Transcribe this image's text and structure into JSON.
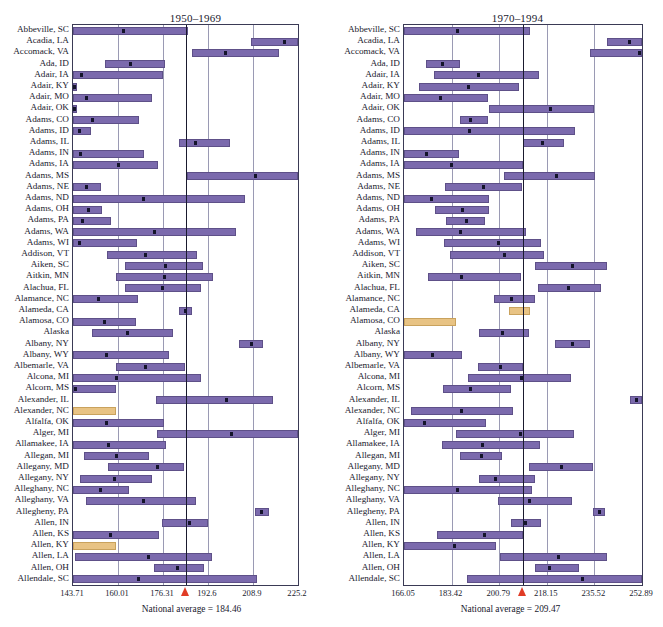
{
  "figure": {
    "width": 663,
    "height": 627,
    "bar_color": "#7b6aad",
    "highlight_color": "#e8c384",
    "marker_color": "#14142b",
    "avg_line_color": "#1a1a2e",
    "arrow_color": "#e03c26",
    "grid_color": "#9a9ab4"
  },
  "chart_data": [
    {
      "type": "bar",
      "panel": "left",
      "title": "1950–1969",
      "xlabel": "",
      "ylabel": "",
      "grid": true,
      "orientation": "horizontal",
      "xlim": [
        143.71,
        225.2
      ],
      "xticks": [
        143.71,
        160.01,
        176.31,
        192.6,
        208.9,
        225.2
      ],
      "xticklabels": [
        "143.71",
        "160.01",
        "176.31",
        "192.6",
        "208.9",
        "225.2"
      ],
      "annotation": "National average = 184.46",
      "national_average": 184.46,
      "categories": [
        "Abbeville, SC",
        "Acadia, LA",
        "Accomack, VA",
        "Ada, ID",
        "Adair, IA",
        "Adair, KY",
        "Adair, MO",
        "Adair, OK",
        "Adams, CO",
        "Adams, ID",
        "Adams, IL",
        "Adams, IN",
        "Adams, IA",
        "Adams, MS",
        "Adams, NE",
        "Adams, ND",
        "Adams, OH",
        "Adams, PA",
        "Adams, WA",
        "Adams, WI",
        "Addison, VT",
        "Aiken, SC",
        "Aitkin, MN",
        "Alachua, FL",
        "Alamance, NC",
        "Alameda, CA",
        "Alamosa, CO",
        "Alaska",
        "Albany, NY",
        "Albany, WY",
        "Albemarle, VA",
        "Alcona, MI",
        "Alcorn, MS",
        "Alexander, IL",
        "Alexander, NC",
        "Alfalfa, OK",
        "Alger, MI",
        "Allamakee, IA",
        "Allegan, MI",
        "Allegany, MD",
        "Allegany, NY",
        "Alleghany, NC",
        "Alleghany, VA",
        "Allegheny, PA",
        "Allen, IN",
        "Allen, KS",
        "Allen, KY",
        "Allen, LA",
        "Allen, OH",
        "Allendale, SC"
      ],
      "ranges": [
        {
          "low": 143.71,
          "high": 185.2,
          "mean": 161.9,
          "highlight": false
        },
        {
          "low": 208.0,
          "high": 225.2,
          "mean": 220.3,
          "highlight": false
        },
        {
          "low": 186.9,
          "high": 218.2,
          "mean": 198.9,
          "highlight": false
        },
        {
          "low": 155.3,
          "high": 176.9,
          "mean": 164.6,
          "highlight": false
        },
        {
          "low": 143.71,
          "high": 176.3,
          "mean": 146.9,
          "highlight": false
        },
        {
          "low": 143.71,
          "high": 145.1,
          "mean": 144.2,
          "highlight": false
        },
        {
          "low": 143.71,
          "high": 172.2,
          "mean": 148.6,
          "highlight": false
        },
        {
          "low": 143.71,
          "high": 145.1,
          "mean": 144.2,
          "highlight": false
        },
        {
          "low": 143.71,
          "high": 167.5,
          "mean": 150.8,
          "highlight": false
        },
        {
          "low": 143.71,
          "high": 150.1,
          "mean": 146.2,
          "highlight": false
        },
        {
          "low": 182.0,
          "high": 200.5,
          "mean": 188.2,
          "highlight": false
        },
        {
          "low": 143.71,
          "high": 169.4,
          "mean": 146.4,
          "highlight": false
        },
        {
          "low": 143.71,
          "high": 174.4,
          "mean": 160.3,
          "highlight": false
        },
        {
          "low": 185.0,
          "high": 225.2,
          "mean": 209.9,
          "highlight": false
        },
        {
          "low": 143.71,
          "high": 153.9,
          "mean": 148.5,
          "highlight": false
        },
        {
          "low": 143.71,
          "high": 205.9,
          "mean": 169.2,
          "highlight": false
        },
        {
          "low": 143.71,
          "high": 154.2,
          "mean": 149.2,
          "highlight": false
        },
        {
          "low": 143.71,
          "high": 157.5,
          "mean": 147.0,
          "highlight": false
        },
        {
          "low": 143.71,
          "high": 202.6,
          "mean": 173.1,
          "highlight": false
        },
        {
          "low": 143.71,
          "high": 166.8,
          "mean": 145.9,
          "highlight": false
        },
        {
          "low": 156.0,
          "high": 188.8,
          "mean": 169.8,
          "highlight": false
        },
        {
          "low": 162.5,
          "high": 190.9,
          "mean": 177.1,
          "highlight": false
        },
        {
          "low": 159.4,
          "high": 194.4,
          "mean": 177.0,
          "highlight": false
        },
        {
          "low": 162.4,
          "high": 190.2,
          "mean": 176.2,
          "highlight": false
        },
        {
          "low": 143.71,
          "high": 167.1,
          "mean": 153.1,
          "highlight": false
        },
        {
          "low": 182.0,
          "high": 186.9,
          "mean": 184.4,
          "highlight": false
        },
        {
          "low": 143.71,
          "high": 166.4,
          "mean": 155.0,
          "highlight": false
        },
        {
          "low": 150.6,
          "high": 180.0,
          "mean": 163.6,
          "highlight": false
        },
        {
          "low": 204.0,
          "high": 212.5,
          "mean": 208.3,
          "highlight": false
        },
        {
          "low": 143.71,
          "high": 178.6,
          "mean": 156.0,
          "highlight": false
        },
        {
          "low": 159.3,
          "high": 184.2,
          "mean": 170.0,
          "highlight": false
        },
        {
          "low": 143.71,
          "high": 190.1,
          "mean": 159.5,
          "highlight": false
        },
        {
          "low": 143.71,
          "high": 159.4,
          "mean": 144.5,
          "highlight": false
        },
        {
          "low": 173.8,
          "high": 216.1,
          "mean": 199.4,
          "highlight": false
        },
        {
          "low": 143.71,
          "high": 159.4,
          "mean": 151.0,
          "highlight": true
        },
        {
          "low": 143.71,
          "high": 176.5,
          "mean": 155.7,
          "highlight": false
        },
        {
          "low": 174.0,
          "high": 225.2,
          "mean": 201.2,
          "highlight": false
        },
        {
          "low": 143.71,
          "high": 177.4,
          "mean": 156.4,
          "highlight": false
        },
        {
          "low": 147.8,
          "high": 171.1,
          "mean": 159.4,
          "highlight": false
        },
        {
          "low": 156.5,
          "high": 183.9,
          "mean": 174.3,
          "highlight": false
        },
        {
          "low": 146.1,
          "high": 172.3,
          "mean": 158.6,
          "highlight": false
        },
        {
          "low": 143.71,
          "high": 164.1,
          "mean": 153.5,
          "highlight": false
        },
        {
          "low": 148.5,
          "high": 188.2,
          "mean": 169.1,
          "highlight": false
        },
        {
          "low": 209.7,
          "high": 214.6,
          "mean": 212.1,
          "highlight": false
        },
        {
          "low": 176.0,
          "high": 192.7,
          "mean": 185.8,
          "highlight": false
        },
        {
          "low": 143.71,
          "high": 175.0,
          "mean": 157.2,
          "highlight": false
        },
        {
          "low": 143.71,
          "high": 159.4,
          "mean": 151.4,
          "highlight": true
        },
        {
          "low": 144.6,
          "high": 194.2,
          "mean": 170.9,
          "highlight": false
        },
        {
          "low": 173.0,
          "high": 191.1,
          "mean": 181.6,
          "highlight": false
        },
        {
          "low": 143.71,
          "high": 210.2,
          "mean": 167.3,
          "highlight": false
        }
      ]
    },
    {
      "type": "bar",
      "panel": "right",
      "title": "1970–1994",
      "xlabel": "",
      "ylabel": "",
      "grid": true,
      "orientation": "horizontal",
      "xlim": [
        166.05,
        252.89
      ],
      "xticks": [
        166.05,
        183.42,
        200.79,
        218.15,
        235.52,
        252.89
      ],
      "xticklabels": [
        "166.05",
        "183.42",
        "200.79",
        "218.15",
        "235.52",
        "252.89"
      ],
      "annotation": "National average = 209.47",
      "national_average": 209.47,
      "categories": [
        "Abbeville, SC",
        "Acadia, LA",
        "Accomack, VA",
        "Ada, ID",
        "Adair, IA",
        "Adair, KY",
        "Adair, MO",
        "Adair, OK",
        "Adams, CO",
        "Adams, ID",
        "Adams, IL",
        "Adams, IN",
        "Adams, IA",
        "Adams, MS",
        "Adams, NE",
        "Adams, ND",
        "Adams, OH",
        "Adams, PA",
        "Adams, WA",
        "Adams, WI",
        "Addison, VT",
        "Aiken, SC",
        "Aitkin, MN",
        "Alachua, FL",
        "Alamance, NC",
        "Alameda, CA",
        "Alamosa, CO",
        "Alaska",
        "Albany, NY",
        "Albany, WY",
        "Albemarle, VA",
        "Alcona, MI",
        "Alcorn, MS",
        "Alexander, IL",
        "Alexander, NC",
        "Alfalfa, OK",
        "Alger, MI",
        "Allamakee, IA",
        "Allegan, MI",
        "Allegany, MD",
        "Allegany, NY",
        "Alleghany, NC",
        "Alleghany, VA",
        "Allegheny, PA",
        "Allen, IN",
        "Allen, KS",
        "Allen, KY",
        "Allen, LA",
        "Allen, OH",
        "Allendale, SC"
      ],
      "ranges": [
        {
          "low": 166.05,
          "high": 211.9,
          "mean": 185.7,
          "highlight": false
        },
        {
          "low": 240.2,
          "high": 252.89,
          "mean": 248.5,
          "highlight": false
        },
        {
          "low": 234.0,
          "high": 252.89,
          "mean": 252.0,
          "highlight": false
        },
        {
          "low": 174.1,
          "high": 186.5,
          "mean": 180.1,
          "highlight": false
        },
        {
          "low": 177.0,
          "high": 215.3,
          "mean": 193.4,
          "highlight": false
        },
        {
          "low": 171.4,
          "high": 208.0,
          "mean": 189.5,
          "highlight": false
        },
        {
          "low": 166.05,
          "high": 196.8,
          "mean": 179.3,
          "highlight": false
        },
        {
          "low": 197.0,
          "high": 235.3,
          "mean": 219.6,
          "highlight": false
        },
        {
          "low": 186.4,
          "high": 196.8,
          "mean": 190.4,
          "highlight": false
        },
        {
          "low": 166.05,
          "high": 228.6,
          "mean": 189.8,
          "highlight": false
        },
        {
          "low": 209.47,
          "high": 224.6,
          "mean": 216.5,
          "highlight": false
        },
        {
          "low": 166.05,
          "high": 186.1,
          "mean": 174.1,
          "highlight": false
        },
        {
          "low": 166.05,
          "high": 209.47,
          "mean": 183.4,
          "highlight": false
        },
        {
          "low": 202.6,
          "high": 235.9,
          "mean": 221.6,
          "highlight": false
        },
        {
          "low": 180.9,
          "high": 209.0,
          "mean": 195.1,
          "highlight": false
        },
        {
          "low": 166.05,
          "high": 197.0,
          "mean": 176.2,
          "highlight": false
        },
        {
          "low": 177.2,
          "high": 197.2,
          "mean": 187.3,
          "highlight": false
        },
        {
          "low": 181.3,
          "high": 195.7,
          "mean": 188.9,
          "highlight": false
        },
        {
          "low": 170.6,
          "high": 210.7,
          "mean": 186.8,
          "highlight": false
        },
        {
          "low": 180.6,
          "high": 216.2,
          "mean": 200.5,
          "highlight": false
        },
        {
          "low": 183.0,
          "high": 217.2,
          "mean": 202.9,
          "highlight": false
        },
        {
          "low": 213.8,
          "high": 240.2,
          "mean": 227.5,
          "highlight": false
        },
        {
          "low": 174.9,
          "high": 208.8,
          "mean": 187.2,
          "highlight": false
        },
        {
          "low": 215.0,
          "high": 238.0,
          "mean": 226.2,
          "highlight": false
        },
        {
          "low": 199.0,
          "high": 213.8,
          "mean": 205.4,
          "highlight": false
        },
        {
          "low": 204.5,
          "high": 212.0,
          "mean": 208.9,
          "highlight": true
        },
        {
          "low": 166.05,
          "high": 185.2,
          "mean": 175.6,
          "highlight": true
        },
        {
          "low": 193.5,
          "high": 211.5,
          "mean": 201.9,
          "highlight": false
        },
        {
          "low": 221.0,
          "high": 234.0,
          "mean": 227.5,
          "highlight": false
        },
        {
          "low": 166.05,
          "high": 187.2,
          "mean": 176.6,
          "highlight": false
        },
        {
          "low": 193.0,
          "high": 209.47,
          "mean": 201.3,
          "highlight": false
        },
        {
          "low": 189.3,
          "high": 227.0,
          "mean": 209.1,
          "highlight": false
        },
        {
          "low": 180.2,
          "high": 205.0,
          "mean": 190.4,
          "highlight": false
        },
        {
          "low": 248.6,
          "high": 252.89,
          "mean": 250.8,
          "highlight": false
        },
        {
          "low": 168.6,
          "high": 205.7,
          "mean": 187.0,
          "highlight": false
        },
        {
          "low": 166.05,
          "high": 196.0,
          "mean": 173.6,
          "highlight": false
        },
        {
          "low": 185.0,
          "high": 228.0,
          "mean": 208.7,
          "highlight": false
        },
        {
          "low": 180.0,
          "high": 215.5,
          "mean": 194.7,
          "highlight": false
        },
        {
          "low": 186.5,
          "high": 201.7,
          "mean": 194.3,
          "highlight": false
        },
        {
          "low": 211.5,
          "high": 235.0,
          "mean": 223.4,
          "highlight": false
        },
        {
          "low": 193.5,
          "high": 213.8,
          "mean": 199.6,
          "highlight": false
        },
        {
          "low": 166.05,
          "high": 212.8,
          "mean": 185.6,
          "highlight": false
        },
        {
          "low": 200.3,
          "high": 227.3,
          "mean": 211.7,
          "highlight": false
        },
        {
          "low": 235.0,
          "high": 239.5,
          "mean": 237.4,
          "highlight": false
        },
        {
          "low": 205.2,
          "high": 216.0,
          "mean": 210.4,
          "highlight": false
        },
        {
          "low": 178.2,
          "high": 209.47,
          "mean": 195.3,
          "highlight": false
        },
        {
          "low": 166.05,
          "high": 199.5,
          "mean": 184.3,
          "highlight": false
        },
        {
          "low": 201.0,
          "high": 240.0,
          "mean": 222.6,
          "highlight": false
        },
        {
          "low": 214.0,
          "high": 229.8,
          "mean": 219.2,
          "highlight": false
        },
        {
          "low": 189.0,
          "high": 252.89,
          "mean": 231.0,
          "highlight": false
        }
      ]
    }
  ]
}
